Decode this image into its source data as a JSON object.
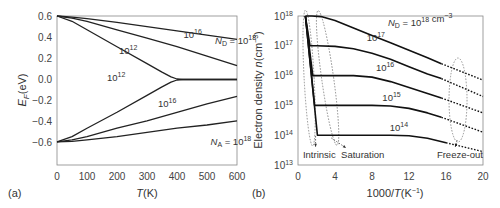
{
  "chart_data": [
    {
      "panel": "(a)",
      "type": "line",
      "title": "",
      "xlabel": "T(K)",
      "ylabel": "E_F(eV)",
      "xlim": [
        0,
        600
      ],
      "ylim": [
        -0.8,
        0.6
      ],
      "xticks": [
        0,
        100,
        200,
        300,
        400,
        500,
        600
      ],
      "yticks": [
        0.6,
        0.4,
        0.2,
        0.0,
        -0.2,
        -0.4,
        -0.6
      ],
      "ytick_labels": [
        "0.6",
        "0.4",
        "0.2",
        "0.0",
        "−0.2",
        "−0.4",
        "−0.6"
      ],
      "grid": false,
      "series": [
        {
          "name": "N_D = 10^18",
          "x": [
            0,
            50,
            100,
            200,
            300,
            400,
            500,
            600
          ],
          "y": [
            0.6,
            0.59,
            0.575,
            0.54,
            0.5,
            0.46,
            0.42,
            0.38
          ]
        },
        {
          "name": "N_D = 10^16",
          "x": [
            0,
            50,
            100,
            200,
            300,
            400,
            500,
            600
          ],
          "y": [
            0.6,
            0.58,
            0.55,
            0.47,
            0.39,
            0.31,
            0.22,
            0.13
          ]
        },
        {
          "name": "N_D = 10^12",
          "x": [
            0,
            50,
            100,
            200,
            300,
            350,
            380,
            400,
            420,
            450,
            600
          ],
          "y": [
            0.6,
            0.55,
            0.47,
            0.31,
            0.15,
            0.07,
            0.025,
            0.005,
            0.0,
            0.0,
            0.0
          ]
        },
        {
          "name": "N_A = 10^12",
          "x": [
            0,
            50,
            100,
            200,
            300,
            350,
            380,
            400,
            420,
            450,
            600
          ],
          "y": [
            -0.59,
            -0.54,
            -0.46,
            -0.31,
            -0.15,
            -0.07,
            -0.025,
            -0.005,
            0.0,
            0.0,
            0.0
          ]
        },
        {
          "name": "N_A = 10^16",
          "x": [
            0,
            50,
            100,
            200,
            300,
            400,
            500,
            600
          ],
          "y": [
            -0.59,
            -0.57,
            -0.54,
            -0.46,
            -0.39,
            -0.31,
            -0.23,
            -0.16
          ]
        },
        {
          "name": "N_A = 10^18",
          "x": [
            0,
            50,
            100,
            200,
            300,
            400,
            500,
            600
          ],
          "y": [
            -0.59,
            -0.585,
            -0.57,
            -0.54,
            -0.5,
            -0.46,
            -0.43,
            -0.39
          ]
        }
      ],
      "annotations": [
        {
          "text": "10",
          "sup": "16",
          "x": 455,
          "y": 0.39
        },
        {
          "text": "N_D = 10",
          "sup": "18",
          "x": 560,
          "y": 0.34
        },
        {
          "text": "10",
          "sup": "12",
          "x": 240,
          "y": 0.24
        },
        {
          "text": "10",
          "sup": "12",
          "x": 200,
          "y": -0.01
        },
        {
          "text": "10",
          "sup": "16",
          "x": 370,
          "y": -0.26
        },
        {
          "text": "N_A = 10",
          "sup": "18",
          "x": 545,
          "y": -0.62
        }
      ]
    },
    {
      "panel": "(b)",
      "type": "line",
      "title": "",
      "xlabel": "1000/T(K⁻¹)",
      "ylabel": "Electron density n(cm⁻³)",
      "xlim": [
        0,
        20
      ],
      "ylim": [
        10000000000000.0,
        1e+18
      ],
      "yscale": "log",
      "xticks": [
        0,
        4,
        8,
        12,
        16,
        20
      ],
      "yticks": [
        1e+18,
        1e+17,
        1e+16,
        1000000000000000.0,
        100000000000000.0,
        10000000000000.0
      ],
      "ytick_labels": [
        "10^18",
        "10^17",
        "10^16",
        "10^15",
        "10^14",
        "10^13"
      ],
      "grid": false,
      "series": [
        {
          "name": "N_D = 10^18",
          "x": [
            0.8,
            1.5,
            2.5,
            4,
            6,
            8,
            10,
            12,
            14,
            15.5
          ],
          "log10y": [
            18.0,
            18.0,
            17.98,
            17.85,
            17.6,
            17.35,
            17.1,
            16.85,
            16.6,
            16.4
          ],
          "dashed_from": 15.5,
          "dashed_x": [
            15.5,
            20
          ],
          "dashed_log10y": [
            16.4,
            15.85
          ]
        },
        {
          "name": "N_D = 10^17",
          "x": [
            0.8,
            1.3,
            2,
            4,
            6,
            8,
            10,
            12,
            14,
            15.5
          ],
          "log10y": [
            18.0,
            17.0,
            17.0,
            16.98,
            16.9,
            16.75,
            16.55,
            16.3,
            16.05,
            15.9
          ],
          "dashed_x": [
            15.5,
            20
          ],
          "dashed_log10y": [
            15.9,
            15.3
          ]
        },
        {
          "name": "N_D = 10^16",
          "x": [
            0.8,
            1.6,
            2.5,
            6,
            8,
            10,
            12,
            14,
            15.5
          ],
          "log10y": [
            18.0,
            16.0,
            16.0,
            16.0,
            15.95,
            15.8,
            15.6,
            15.4,
            15.25
          ],
          "dashed_x": [
            15.5,
            20
          ],
          "dashed_log10y": [
            15.25,
            14.75
          ]
        },
        {
          "name": "N_D = 10^15",
          "x": [
            0.8,
            1.8,
            3,
            8,
            10,
            12,
            14,
            15.5
          ],
          "log10y": [
            18.0,
            15.0,
            15.0,
            15.0,
            14.98,
            14.9,
            14.75,
            14.6
          ],
          "dashed_x": [
            15.5,
            20
          ],
          "dashed_log10y": [
            14.6,
            14.1
          ]
        },
        {
          "name": "N_D = 10^14",
          "x": [
            0.8,
            2.1,
            3,
            8,
            10,
            12,
            14,
            16
          ],
          "log10y": [
            18.0,
            14.0,
            14.0,
            14.0,
            14.0,
            13.98,
            13.9,
            13.75
          ],
          "dashed_x": [
            16,
            20
          ],
          "dashed_log10y": [
            13.75,
            13.45
          ]
        }
      ],
      "annotations": [
        {
          "text": "N_D = 10",
          "sup": "18",
          "suffix": " cm",
          "sup2": "−3",
          "x": 10.8,
          "log10y": 17.65
        },
        {
          "text": "10",
          "sup": "17",
          "x": 8.5,
          "log10y": 17.15
        },
        {
          "text": "10",
          "sup": "16",
          "x": 9.5,
          "log10y": 16.15
        },
        {
          "text": "10",
          "sup": "15",
          "x": 10.2,
          "log10y": 15.15
        },
        {
          "text": "10",
          "sup": "14",
          "x": 11.0,
          "log10y": 14.15
        },
        {
          "text": "Intrinsic",
          "x": 2.3,
          "log10y": 13.3
        },
        {
          "text": "Saturation",
          "x": 7.0,
          "log10y": 13.3
        },
        {
          "text": "Freeze-out",
          "x": 17.5,
          "log10y": 13.3
        }
      ],
      "regions": [
        {
          "name": "Intrinsic",
          "shape": "dashed-ellipse"
        },
        {
          "name": "Saturation",
          "shape": "dashed-ellipse"
        },
        {
          "name": "Freeze-out",
          "shape": "dashed-ellipse"
        }
      ]
    }
  ],
  "labels": {
    "panel_a": "(a)",
    "panel_b": "(b)",
    "a_xlabel_italic": "T",
    "a_xlabel_rest": "(K)",
    "a_ylabel_italic": "E",
    "a_ylabel_sub": "F",
    "a_ylabel_rest": "(eV)",
    "b_xlabel_pre": "1000/",
    "b_xlabel_italic": "T",
    "b_xlabel_rest": "(K",
    "b_xlabel_sup": "−1",
    "b_xlabel_close": ")",
    "b_ylabel_pre": "Electron density ",
    "b_ylabel_italic": "n",
    "b_ylabel_rest": "(cm",
    "b_ylabel_sup": "−3",
    "b_ylabel_close": ")",
    "intrinsic": "Intrinsic",
    "saturation": "Saturation",
    "freezeout": "Freeze-out"
  }
}
